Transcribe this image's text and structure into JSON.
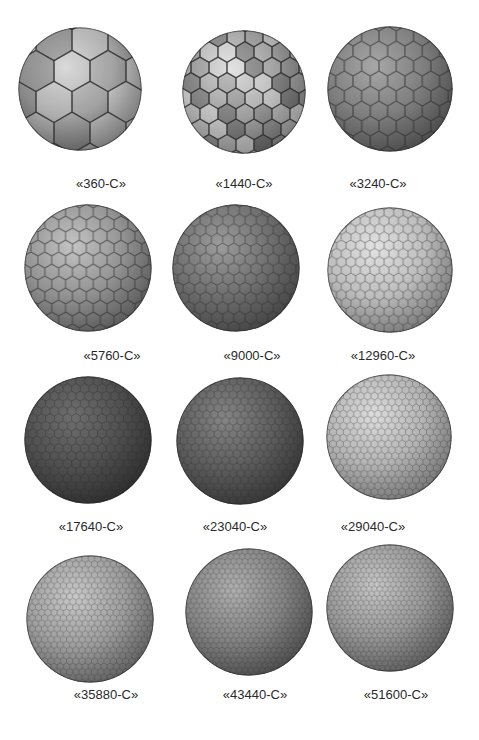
{
  "figure": {
    "items": [
      {
        "label": "«360-C»",
        "cx": 80,
        "cy": 89,
        "r": 62,
        "tone": "#b9b9b9",
        "dark": "#6a6a6a",
        "light": "#e6e6e6",
        "cell": 36,
        "style": "poly"
      },
      {
        "label": "«1440-C»",
        "cx": 244,
        "cy": 92,
        "r": 62,
        "tone": "#a8a8a8",
        "dark": "#6e6e6e",
        "light": "#dadada",
        "cell": 18,
        "style": "poly"
      },
      {
        "label": "«3240-C»",
        "cx": 390,
        "cy": 89,
        "r": 63,
        "tone": "#7e7e7e",
        "dark": "#4c4c4c",
        "light": "#a8a8a8",
        "cell": 10,
        "style": "hex"
      },
      {
        "label": "«5760-C»",
        "cx": 88,
        "cy": 268,
        "r": 64,
        "tone": "#939393",
        "dark": "#5a5a5a",
        "light": "#c4c4c4",
        "cell": 8,
        "style": "hex"
      },
      {
        "label": "«9000-C»",
        "cx": 236,
        "cy": 268,
        "r": 64,
        "tone": "#6f6f6f",
        "dark": "#454545",
        "light": "#9c9c9c",
        "cell": 6.5,
        "style": "hex"
      },
      {
        "label": "«12960-C»",
        "cx": 390,
        "cy": 270,
        "r": 63,
        "tone": "#bdbdbd",
        "dark": "#7a7a7a",
        "light": "#e2e2e2",
        "cell": 5.5,
        "style": "hex"
      },
      {
        "label": "«17640-C»",
        "cx": 88,
        "cy": 440,
        "r": 64,
        "tone": "#4f4f4f",
        "dark": "#2e2e2e",
        "light": "#6e6e6e",
        "cell": 5,
        "style": "hex"
      },
      {
        "label": "«23040-C»",
        "cx": 240,
        "cy": 441,
        "r": 64,
        "tone": "#5d5d5d",
        "dark": "#363636",
        "light": "#858585",
        "cell": 4.4,
        "style": "hex"
      },
      {
        "label": "«29040-C»",
        "cx": 389,
        "cy": 437,
        "r": 63,
        "tone": "#b4b4b4",
        "dark": "#787878",
        "light": "#dcdcdc",
        "cell": 4,
        "style": "hex"
      },
      {
        "label": "«35880-C»",
        "cx": 90,
        "cy": 619,
        "r": 64,
        "tone": "#9e9e9e",
        "dark": "#626262",
        "light": "#c8c8c8",
        "cell": 3.6,
        "style": "hex"
      },
      {
        "label": "«43440-C»",
        "cx": 249,
        "cy": 612,
        "r": 64,
        "tone": "#858585",
        "dark": "#4e4e4e",
        "light": "#b0b0b0",
        "cell": 3.3,
        "style": "hex"
      },
      {
        "label": "«51600-C»",
        "cx": 390,
        "cy": 608,
        "r": 64,
        "tone": "#9a9a9a",
        "dark": "#5e5e5e",
        "light": "#c6c6c6",
        "cell": 3.1,
        "style": "hex"
      }
    ],
    "captions_y": [
      184,
      356,
      527,
      695
    ],
    "caption_x": [
      101,
      244,
      378,
      112,
      252,
      383,
      91,
      235,
      373,
      106,
      255,
      396
    ]
  }
}
